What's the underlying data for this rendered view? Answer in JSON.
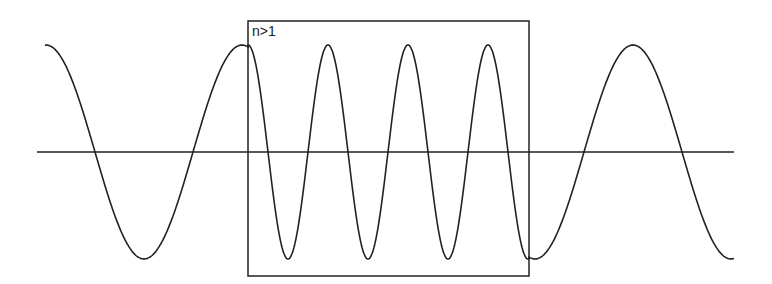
{
  "diagram": {
    "region_label": "n>1",
    "stroke_color": "#222222",
    "background": "#ffffff",
    "axis": {
      "x1": 37,
      "x2": 734,
      "y": 152
    },
    "box": {
      "x": 248,
      "y": 21,
      "width": 281,
      "height": 255
    },
    "wave": {
      "center_y": 152,
      "amplitude": 107,
      "segments": [
        {
          "name": "outside-left",
          "x_start": 45,
          "x_end": 248,
          "period": 196,
          "peak_x": 242
        },
        {
          "name": "inside-medium",
          "x_start": 248,
          "x_end": 529,
          "period": 80,
          "peak_x": 248
        },
        {
          "name": "outside-right",
          "x_start": 529,
          "x_end": 734,
          "period": 196,
          "peak_x": 633
        }
      ]
    }
  }
}
